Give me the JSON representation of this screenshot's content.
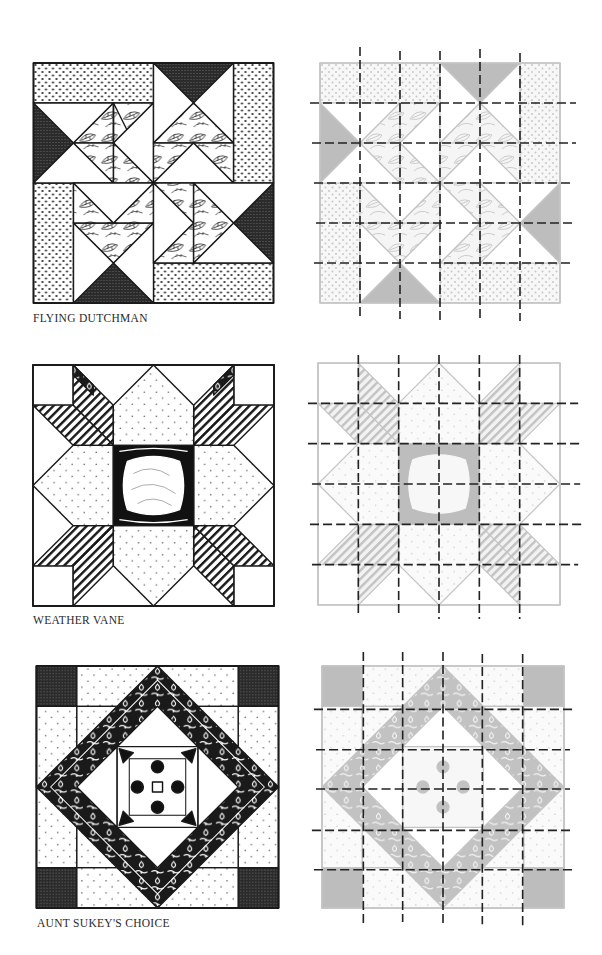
{
  "page": {
    "background": "#ffffff"
  },
  "colors": {
    "ink": "#1a1a1a",
    "dark_fabric": "#2b2b2b",
    "gray_fabric": "#bdbdbd",
    "gray_line": "#c4c4c4",
    "dashed_grid": "#222222"
  },
  "blocks": [
    {
      "name": "Flying Dutchman",
      "caption": "FLYING DUTCHMAN",
      "grid": "6x6",
      "view": "pattern illustration",
      "cutting_view": "gray pattern overlaid with dashed 6x6 cutting grid"
    },
    {
      "name": "Weather Vane",
      "caption": "WEATHER VANE",
      "grid": "6x6",
      "view": "pattern illustration",
      "cutting_view": "gray pattern overlaid with dashed 6x6 cutting grid"
    },
    {
      "name": "Aunt Sukey's Choice",
      "caption": "AUNT SUKEY'S CHOICE",
      "grid": "6x6",
      "view": "pattern illustration",
      "cutting_view": "gray pattern overlaid with dashed 6x6 cutting grid"
    }
  ]
}
